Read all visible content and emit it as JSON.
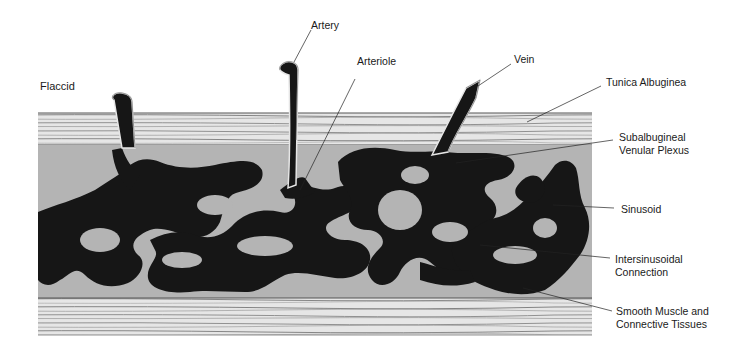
{
  "title": "Flaccid",
  "colors": {
    "background": "#ffffff",
    "tissue_gray": "#b4b4b4",
    "sinusoid_black": "#161616",
    "band_light": "#e4e4e4",
    "band_line": "#6a6a6a",
    "leader_line": "#222222",
    "text": "#1a1a1a"
  },
  "labels": {
    "artery": "Artery",
    "arteriole": "Arteriole",
    "vein": "Vein",
    "tunica": "Tunica Albuginea",
    "plexus_line1": "Subalbugineal",
    "plexus_line2": "Venular Plexus",
    "sinusoid": "Sinusoid",
    "intersinusoidal_line1": "Intersinusoidal",
    "intersinusoidal_line2": "Connection",
    "smooth_line1": "Smooth Muscle and",
    "smooth_line2": "Connective Tissues"
  }
}
